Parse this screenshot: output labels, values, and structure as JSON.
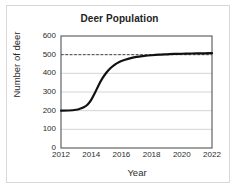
{
  "chart_data": {
    "type": "line",
    "title": "Deer Population",
    "xlabel": "Year",
    "ylabel": "Number of deer",
    "xlim": [
      2012,
      2022
    ],
    "ylim": [
      0,
      600
    ],
    "xticks": [
      "2012",
      "2014",
      "2016",
      "2018",
      "2020",
      "2022"
    ],
    "xtick_values": [
      2012,
      2014,
      2016,
      2018,
      2020,
      2022
    ],
    "yticks": [
      "0",
      "100",
      "200",
      "300",
      "400",
      "500",
      "600"
    ],
    "ytick_values": [
      0,
      100,
      200,
      300,
      400,
      500,
      600
    ],
    "grid": "horizontal",
    "legend": "none",
    "annotations": [
      {
        "name": "carrying-capacity-asymptote",
        "style": "dashed-horizontal-line",
        "y": 500,
        "color": "#333333"
      }
    ],
    "series": [
      {
        "name": "Deer population",
        "shape": "logistic-s-curve",
        "color": "#111111",
        "line_width": 2.2,
        "x": [
          2012,
          2012.5,
          2013,
          2013.25,
          2013.5,
          2013.75,
          2014,
          2014.25,
          2014.5,
          2014.75,
          2015,
          2015.25,
          2015.5,
          2015.75,
          2016,
          2016.5,
          2017,
          2017.5,
          2018,
          2018.5,
          2019,
          2019.5,
          2020,
          2020.5,
          2021,
          2021.5,
          2022
        ],
        "y": [
          200,
          201,
          205,
          210,
          218,
          232,
          258,
          296,
          338,
          374,
          403,
          426,
          443,
          456,
          466,
          479,
          488,
          493,
          497,
          500,
          502,
          504,
          505,
          506,
          507,
          507,
          508
        ]
      }
    ]
  },
  "figure": {
    "plot_area": {
      "left": 61,
      "top": 36,
      "right": 212,
      "bottom": 148
    },
    "frame_color": "#555555",
    "gridline_color": "#c9c9c9",
    "background": "#ffffff"
  }
}
